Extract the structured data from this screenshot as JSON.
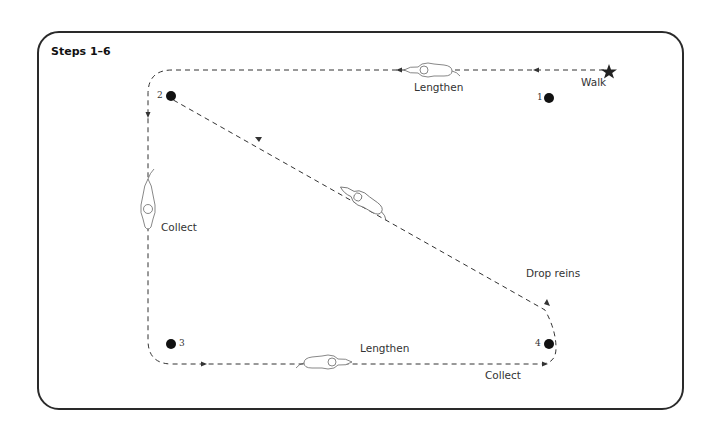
{
  "title": "Steps 1–6",
  "labels": {
    "walk": "Walk",
    "lengthen_top": "Lengthen",
    "collect_left": "Collect",
    "drop_reins": "Drop reins",
    "lengthen_bottom": "Lengthen",
    "collect_bottom": "Collect"
  },
  "markers": [
    {
      "id": "1",
      "label": "1"
    },
    {
      "id": "2",
      "label": "2"
    },
    {
      "id": "3",
      "label": "3"
    },
    {
      "id": "4",
      "label": "4"
    }
  ],
  "colors": {
    "line": "#333333",
    "frame": "#2a2a2a",
    "marker": "#111111"
  },
  "icons": {
    "start": "star-icon",
    "horse": "horse-figure-icon",
    "direction": "arrowhead-icon"
  }
}
